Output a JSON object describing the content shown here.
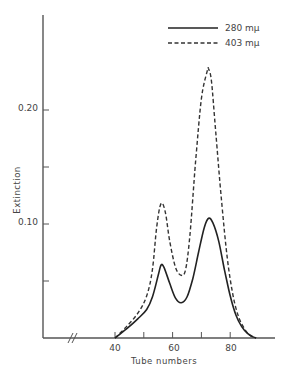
{
  "chart_data": {
    "type": "line",
    "title": "",
    "xlabel": "Tube numbers",
    "ylabel": "Extinction",
    "xlim": [
      30,
      95
    ],
    "ylim": [
      0,
      0.28
    ],
    "x_ticks": [
      40,
      50,
      60,
      70,
      80
    ],
    "x_tick_labels": [
      "40",
      "60",
      "80"
    ],
    "y_ticks": [
      0.05,
      0.1,
      0.15,
      0.2
    ],
    "y_tick_labels": [
      "0.10",
      "0.20"
    ],
    "axis_break": "x-axis break marks (//) near origin",
    "grid": false,
    "legend_position": "top-right",
    "series": [
      {
        "name": "280 mμ",
        "style": "solid",
        "x": [
          40,
          44,
          48,
          51,
          53,
          55,
          56,
          57,
          59,
          61,
          63,
          65,
          67,
          69,
          71,
          72.5,
          74,
          76,
          78,
          80,
          82,
          84,
          86,
          88,
          89
        ],
        "values": [
          0.0,
          0.008,
          0.017,
          0.025,
          0.036,
          0.055,
          0.064,
          0.062,
          0.048,
          0.035,
          0.031,
          0.036,
          0.052,
          0.075,
          0.097,
          0.105,
          0.101,
          0.085,
          0.06,
          0.037,
          0.02,
          0.01,
          0.004,
          0.001,
          0.0
        ]
      },
      {
        "name": "403 mμ",
        "style": "dashed",
        "x": [
          40,
          44,
          48,
          51,
          53,
          54.5,
          56,
          57.5,
          59,
          61,
          63,
          64.5,
          66,
          68,
          70,
          72,
          72.5,
          73.5,
          75,
          77,
          79,
          81,
          83,
          85,
          87,
          89
        ],
        "values": [
          0.0,
          0.01,
          0.022,
          0.037,
          0.06,
          0.098,
          0.118,
          0.11,
          0.085,
          0.062,
          0.055,
          0.06,
          0.09,
          0.155,
          0.21,
          0.234,
          0.236,
          0.225,
          0.18,
          0.12,
          0.07,
          0.037,
          0.018,
          0.008,
          0.002,
          0.0
        ]
      }
    ]
  },
  "legend": {
    "items": [
      {
        "label": "280 mμ",
        "style": "solid"
      },
      {
        "label": "403 mμ",
        "style": "dashed"
      }
    ]
  },
  "axes": {
    "x_label": "Tube numbers",
    "y_label": "Extinction",
    "x_tick_labels": [
      "40",
      "60",
      "80"
    ],
    "y_tick_labels": [
      "0.10",
      "0.20"
    ]
  }
}
